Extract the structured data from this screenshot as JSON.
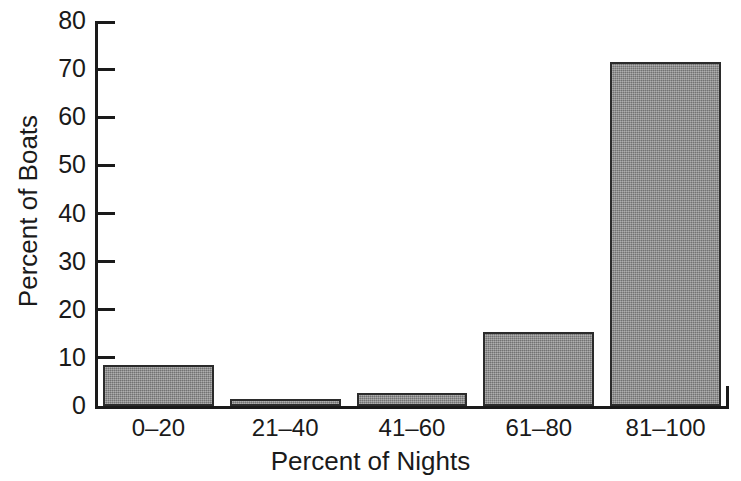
{
  "chart_data": {
    "type": "bar",
    "title": "",
    "subtitle": "",
    "xlabel": "Percent of Nights",
    "ylabel": "Percent of Boats",
    "categories": [
      "0–20",
      "21–40",
      "41–60",
      "61–80",
      "81–100"
    ],
    "values": [
      8.5,
      1.4,
      2.8,
      15.3,
      71.5
    ],
    "ylim": [
      0,
      80
    ],
    "yticks": [
      0,
      10,
      20,
      30,
      40,
      50,
      60,
      70,
      80
    ],
    "ytick_labels": [
      "0",
      "10",
      "20",
      "30",
      "40",
      "50",
      "60",
      "70",
      "80"
    ],
    "grid": false,
    "legend": null,
    "annotations": [],
    "bar_fill_color": "#8d8d8d",
    "bar_edge_color": "#2b2b2b",
    "axis_color": "#1a1a1a",
    "background_color": "#ffffff"
  },
  "figure": {
    "background_color": "#ffffff"
  }
}
